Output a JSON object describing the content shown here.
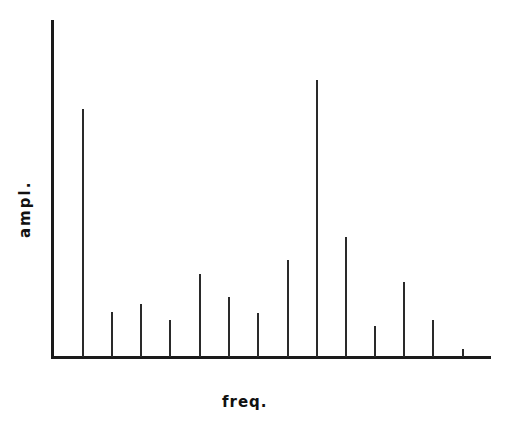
{
  "chart_data": {
    "type": "bar",
    "subtype": "stem/line spectrum",
    "title": "",
    "xlabel": "freq.",
    "ylabel": "ampl.",
    "grid": false,
    "legend": null,
    "x": [
      1,
      2,
      3,
      4,
      5,
      6,
      7,
      8,
      9,
      10,
      11,
      12,
      13,
      14
    ],
    "values": [
      248,
      45,
      53,
      37,
      83,
      60,
      44,
      97,
      277,
      120,
      31,
      75,
      37,
      8
    ],
    "ylim": [
      0,
      337
    ],
    "x_tick_labels": [],
    "y_tick_labels": [],
    "note": "Relative amplitudes estimated in pixels above baseline; no numeric axis ticks shown"
  },
  "layout": {
    "baseline_y": 357,
    "yaxis_x": 52,
    "yaxis_top": 20,
    "xaxis_end": 492,
    "spike_x": [
      83,
      112,
      141,
      170,
      200,
      229,
      258,
      288,
      317,
      346,
      375,
      404,
      433,
      463
    ],
    "color": "#2a2a2a"
  }
}
